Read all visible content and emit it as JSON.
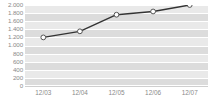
{
  "chart_data": {
    "type": "line",
    "title": "",
    "subtitle": "",
    "xlabel": "",
    "ylabel": "",
    "categories": [
      "12/03",
      "12/04",
      "12/05",
      "12/06",
      "12/07"
    ],
    "values": [
      1200,
      1350,
      1760,
      1840,
      2000
    ],
    "series": [
      {
        "name": "series-1",
        "values": [
          1200,
          1350,
          1760,
          1840,
          2000
        ]
      }
    ],
    "ylim": [
      0,
      2000
    ],
    "ytick_values": [
      2000,
      1800,
      1600,
      1400,
      1200,
      1000,
      800,
      600,
      400,
      200,
      0
    ],
    "ytick_labels": [
      "2.000",
      "1.800",
      "1.600",
      "1.400",
      "1.200",
      "1.000",
      "800",
      "600",
      "400",
      "200",
      "0"
    ],
    "xtick_labels": [
      "12/03",
      "12/04",
      "12/05",
      "12/06",
      "12/07"
    ],
    "grid": true,
    "grid_orientation": "horizontal",
    "legend": false,
    "legend_position": "none",
    "marker": "circle",
    "colors": {
      "line": "#333333",
      "marker_fill": "#ffffff",
      "marker_stroke": "#555555",
      "plot_background": "#e9e9e9",
      "band": "#dcdcdc",
      "gridline": "#ffffff",
      "tick_label": "#8a8a8a",
      "page_background": "#ffffff"
    }
  }
}
